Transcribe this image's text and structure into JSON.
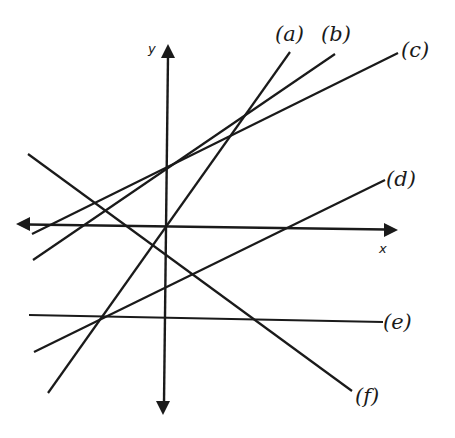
{
  "diagram": {
    "type": "coordinate-plane-lines",
    "axes": {
      "x_label": "x",
      "y_label": "y",
      "origin": [
        166,
        226
      ]
    },
    "lines": [
      {
        "id": "a",
        "label": "(a)",
        "x1": 48,
        "y1": 393,
        "x2": 290,
        "y2": 52
      },
      {
        "id": "b",
        "label": "(b)",
        "x1": 33,
        "y1": 260,
        "x2": 335,
        "y2": 54
      },
      {
        "id": "c",
        "label": "(c)",
        "x1": 32,
        "y1": 234,
        "x2": 398,
        "y2": 53
      },
      {
        "id": "d",
        "label": "(d)",
        "x1": 34,
        "y1": 352,
        "x2": 385,
        "y2": 180
      },
      {
        "id": "e",
        "label": "(e)",
        "x1": 29,
        "y1": 315,
        "x2": 383,
        "y2": 322
      },
      {
        "id": "f",
        "label": "(f)",
        "x1": 28,
        "y1": 154,
        "x2": 352,
        "y2": 391
      }
    ],
    "labels": {
      "a": "(a)",
      "b": "(b)",
      "c": "(c)",
      "d": "(d)",
      "e": "(e)",
      "f": "(f)"
    }
  }
}
